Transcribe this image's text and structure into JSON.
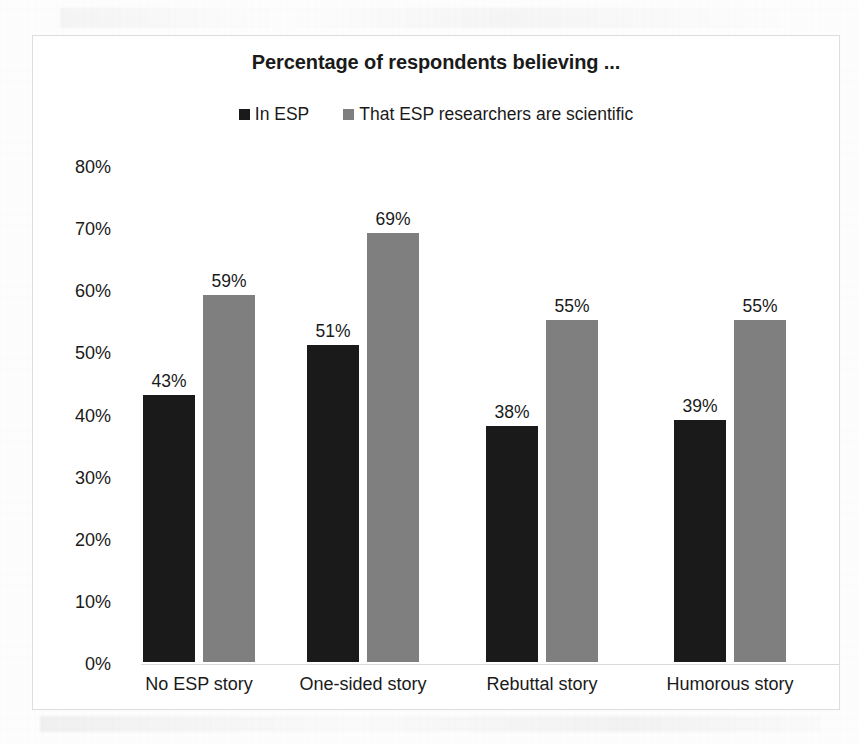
{
  "chart_data": {
    "type": "bar",
    "title": "Percentage of respondents believing ...",
    "xlabel": "",
    "ylabel": "",
    "categories": [
      "No ESP story",
      "One-sided story",
      "Rebuttal story",
      "Humorous story"
    ],
    "series": [
      {
        "name": "In ESP",
        "color": "#1a1a1a",
        "values": [
          43,
          51,
          38,
          39
        ],
        "labels": [
          "43%",
          "51%",
          "38%",
          "39%"
        ]
      },
      {
        "name": "That ESP researchers are scientific",
        "color": "#7f7f7f",
        "values": [
          59,
          69,
          55,
          55
        ],
        "labels": [
          "59%",
          "69%",
          "55%",
          "55%"
        ]
      }
    ],
    "ylim": [
      0,
      80
    ],
    "y_ticks": [
      0,
      10,
      20,
      30,
      40,
      50,
      60,
      70,
      80
    ],
    "y_tick_labels": [
      "0%",
      "10%",
      "20%",
      "30%",
      "40%",
      "50%",
      "60%",
      "70%",
      "80%"
    ],
    "grid": false,
    "legend_position": "top-center",
    "value_labels": true,
    "frame_border_color": "#dedede",
    "axis_color": "#d9d9d9",
    "background": "#ffffff"
  },
  "legend": {
    "items": [
      {
        "label": "In ESP",
        "color": "#1a1a1a"
      },
      {
        "label": "That ESP researchers are scientific",
        "color": "#7f7f7f"
      }
    ]
  }
}
